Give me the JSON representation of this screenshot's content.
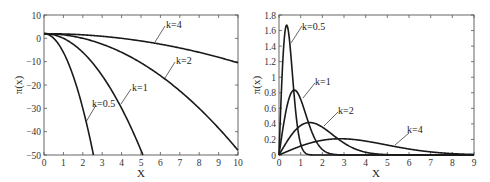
{
  "chart_data": [
    {
      "type": "line",
      "title": "",
      "xlabel": "X",
      "ylabel": "π(x)",
      "xlim": [
        0,
        10
      ],
      "ylim": [
        -50,
        10
      ],
      "xticks": [
        "0",
        "1",
        "2",
        "3",
        "4",
        "5",
        "6",
        "7",
        "8",
        "9",
        "10"
      ],
      "yticks": [
        "10",
        "0",
        "−10",
        "−20",
        "−30",
        "−40",
        "−50"
      ],
      "grid": false,
      "legend": "inline annotations",
      "series": [
        {
          "name": "k=0.5",
          "x": [
            0,
            0.5,
            1,
            1.5,
            2,
            2.5
          ],
          "values": [
            2,
            0,
            -6,
            -16,
            -30,
            -48
          ]
        },
        {
          "name": "k=1",
          "x": [
            0,
            1,
            2,
            3,
            4,
            5
          ],
          "values": [
            2,
            0,
            -6,
            -16,
            -30,
            -48
          ]
        },
        {
          "name": "k=2",
          "x": [
            0,
            2,
            4,
            6,
            8,
            10
          ],
          "values": [
            2,
            0,
            -6,
            -16,
            -30,
            -48
          ]
        },
        {
          "name": "k=4",
          "x": [
            0,
            2,
            4,
            6,
            8,
            10
          ],
          "values": [
            2,
            1.5,
            0,
            -2.5,
            -6,
            -10.5
          ]
        }
      ],
      "annotations": [
        {
          "text": "k=4",
          "at_x": 5.7,
          "at_y": -2.1
        },
        {
          "text": "k=2",
          "at_x": 6.2,
          "at_y": -17
        },
        {
          "text": "k=1",
          "at_x": 3.9,
          "at_y": -28.5
        },
        {
          "text": "k=0.5",
          "at_x": 2.2,
          "at_y": -36.5
        }
      ]
    },
    {
      "type": "line",
      "title": "",
      "xlabel": "X",
      "ylabel": "π(x)",
      "xlim": [
        0,
        9
      ],
      "ylim": [
        0,
        1.8
      ],
      "xticks": [
        "0",
        "1",
        "2",
        "3",
        "4",
        "5",
        "6",
        "7",
        "8",
        "9"
      ],
      "yticks": [
        "1.8",
        "1.6",
        "1.4",
        "1.2",
        "1",
        "0.8",
        "0.6",
        "0.4",
        "0.2",
        "0"
      ],
      "grid": false,
      "legend": "inline annotations",
      "series": [
        {
          "name": "k=0.5",
          "peak_x": 0.35,
          "peak_y": 1.68
        },
        {
          "name": "k=1",
          "peak_x": 0.71,
          "peak_y": 0.86
        },
        {
          "name": "k=2",
          "peak_x": 1.41,
          "peak_y": 0.43
        },
        {
          "name": "k=4",
          "peak_x": 2.83,
          "peak_y": 0.21
        }
      ],
      "annotations": [
        {
          "text": "k=0.5",
          "at_x": 0.5,
          "at_y": 1.45
        },
        {
          "text": "k=1",
          "at_x": 1.0,
          "at_y": 0.72
        },
        {
          "text": "k=2",
          "at_x": 2.1,
          "at_y": 0.36
        },
        {
          "text": "k=4",
          "at_x": 5.2,
          "at_y": 0.13
        }
      ]
    }
  ],
  "left": {
    "xlabel": "X",
    "ylabel": "π(x)",
    "xticks": [
      "0",
      "1",
      "2",
      "3",
      "4",
      "5",
      "6",
      "7",
      "8",
      "9",
      "10"
    ],
    "yticks": [
      "10",
      "0",
      "−10",
      "−20",
      "−30",
      "−40",
      "−50"
    ],
    "labels": {
      "k4": "k=4",
      "k2": "k=2",
      "k1": "k=1",
      "k05": "k=0.5"
    }
  },
  "right": {
    "xlabel": "X",
    "ylabel": "π(x)",
    "xticks": [
      "0",
      "1",
      "2",
      "3",
      "4",
      "5",
      "6",
      "7",
      "8",
      "9"
    ],
    "yticks": [
      "1.8",
      "1.6",
      "1.4",
      "1.2",
      "1",
      "0.8",
      "0.6",
      "0.4",
      "0.2",
      "0"
    ],
    "labels": {
      "k05": "k=0.5",
      "k1": "k=1",
      "k2": "k=2",
      "k4": "k=4"
    }
  }
}
